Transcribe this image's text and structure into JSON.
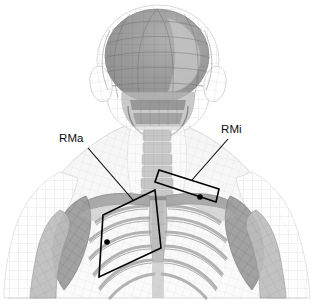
{
  "figure": {
    "type": "anatomical-illustration",
    "view": "anterior",
    "background_color": "#ffffff",
    "width": 315,
    "height": 307
  },
  "annotations": {
    "labels": [
      {
        "id": "rma",
        "text": "RMa",
        "meaning": "rhomboid major region marker",
        "x": 59,
        "y": 133,
        "leader_line": {
          "from": [
            88,
            148
          ],
          "to": [
            133,
            200
          ]
        },
        "marker_dot": {
          "x": 107,
          "y": 242,
          "r": 2.8,
          "color": "#000000"
        }
      },
      {
        "id": "rmi",
        "text": "RMi",
        "meaning": "rhomboid minor region marker",
        "x": 221,
        "y": 124,
        "leader_line": {
          "from": [
            228,
            139
          ],
          "to": [
            192,
            180
          ]
        },
        "marker_dot": {
          "x": 200,
          "y": 197,
          "r": 2.8,
          "color": "#000000"
        }
      }
    ],
    "regions": [
      {
        "id": "rma-quad",
        "label": "RMa",
        "shape": "quadrilateral",
        "points": "155,190 161,248 99,277 103,215",
        "stroke": "#000000",
        "stroke_width": 1.6,
        "fill": "none"
      },
      {
        "id": "rmi-quad",
        "label": "RMi",
        "shape": "quadrilateral",
        "points": "159,170 219,189 216,202 155,182",
        "stroke": "#000000",
        "stroke_width": 1.6,
        "fill": "none"
      }
    ]
  },
  "palette": {
    "skin_mesh": "#c9c9c9",
    "skin_mesh_light": "#e2e2e2",
    "bone_mid": "#9a9a9a",
    "bone_dark": "#7d7d7d",
    "bone_light": "#bdbdbd",
    "skull_shade": "#8e8e8e",
    "outline": "#000000",
    "background": "#ffffff"
  }
}
